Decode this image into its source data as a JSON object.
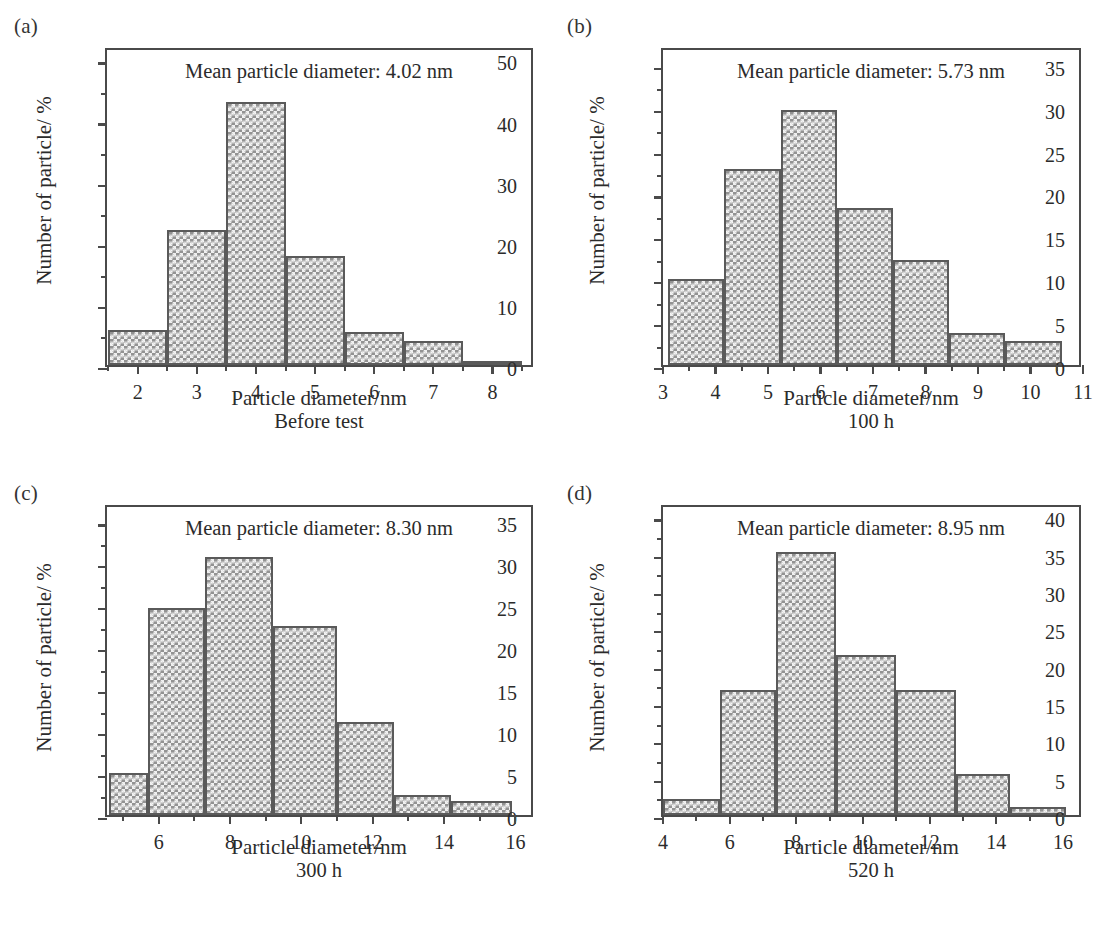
{
  "figure": {
    "background": "#ffffff",
    "ink_color": "#2b2b2b",
    "frame_color": "#4a4a4a",
    "bar_fill": "#b4b4b4",
    "bar_edge": "#5a5a5a"
  },
  "panels": [
    {
      "letter": "(a)",
      "mean_note": "Mean particle diameter: 4.02 nm",
      "xlabel": "Particle diameter/nm",
      "caption": "Before test",
      "ylabel": "Number of particle/ %"
    },
    {
      "letter": "(b)",
      "mean_note": "Mean particle diameter: 5.73 nm",
      "xlabel": "Particle diameter/nm",
      "caption": "100 h",
      "ylabel": "Number of particle/ %"
    },
    {
      "letter": "(c)",
      "mean_note": "Mean particle diameter: 8.30 nm",
      "xlabel": "Particle diameter/nm",
      "caption": "300 h",
      "ylabel": "Number of particle/ %"
    },
    {
      "letter": "(d)",
      "mean_note": "Mean particle diameter: 8.95 nm",
      "xlabel": "Particle diameter/nm",
      "caption": "520 h",
      "ylabel": "Number of particle/ %"
    }
  ],
  "chart_data": [
    {
      "type": "bar",
      "id": "panel-a",
      "title": "(a) Before test",
      "annotation": "Mean particle diameter: 4.02 nm",
      "mean_particle_diameter_nm": 4.02,
      "condition": "Before test",
      "xlabel": "Particle diameter/nm",
      "ylabel": "Number of particle/ %",
      "xlim": [
        1.48,
        8.72
      ],
      "ylim": [
        0,
        52.2
      ],
      "xticks": [
        2,
        3,
        4,
        5,
        6,
        7,
        8
      ],
      "xticklabels": [
        "2",
        "3",
        "4",
        "5",
        "6",
        "7",
        "8"
      ],
      "xminorticks": [
        1.5,
        2.5,
        3.5,
        4.5,
        5.5,
        6.5,
        7.5,
        8.5
      ],
      "yticks": [
        0,
        10,
        20,
        30,
        40,
        50
      ],
      "yticklabels": [
        "0",
        "10",
        "20",
        "30",
        "40",
        "50"
      ],
      "yminorticks": [
        5,
        15,
        25,
        35,
        45
      ],
      "grid": false,
      "legend": null,
      "bin_edges": [
        1.5,
        2.5,
        3.5,
        4.5,
        5.5,
        6.5,
        7.5,
        8.5
      ],
      "bin_centers": [
        2,
        3,
        4,
        5,
        6,
        7,
        8
      ],
      "categories": [
        "2",
        "3",
        "4",
        "5",
        "6",
        "7",
        "8"
      ],
      "values": [
        5.7,
        22.1,
        43.0,
        17.8,
        5.4,
        3.9,
        0.4
      ]
    },
    {
      "type": "bar",
      "id": "panel-b",
      "title": "(b) 100 h",
      "annotation": "Mean particle diameter: 5.73 nm",
      "mean_particle_diameter_nm": 5.73,
      "condition": "100 h",
      "xlabel": "Particle diameter/nm",
      "ylabel": "Number of particle/ %",
      "xlim": [
        3.0,
        11.0
      ],
      "ylim": [
        0,
        37.2
      ],
      "xticks": [
        3,
        4,
        5,
        6,
        7,
        8,
        9,
        10,
        11
      ],
      "xticklabels": [
        "3",
        "4",
        "5",
        "6",
        "7",
        "8",
        "9",
        "10",
        "11"
      ],
      "xminorticks": [
        3.5,
        4.5,
        5.5,
        6.5,
        7.5,
        8.5,
        9.5,
        10.5
      ],
      "yticks": [
        0,
        5,
        10,
        15,
        20,
        25,
        30,
        35
      ],
      "yticklabels": [
        "0",
        "5",
        "10",
        "15",
        "20",
        "25",
        "30",
        "35"
      ],
      "yminorticks": [
        2.5,
        7.5,
        12.5,
        17.5,
        22.5,
        27.5,
        32.5
      ],
      "grid": false,
      "legend": null,
      "bin_edges": [
        3.1,
        4.17,
        5.24,
        6.31,
        7.38,
        8.45,
        9.52,
        10.6
      ],
      "bin_centers": [
        3.64,
        4.71,
        5.78,
        6.85,
        7.92,
        8.99,
        10.06
      ],
      "categories": [
        "3.1-4.2",
        "4.2-5.2",
        "5.2-6.3",
        "6.3-7.4",
        "7.4-8.5",
        "8.5-9.5",
        "9.5-10.6"
      ],
      "values": [
        10.0,
        22.9,
        29.7,
        18.3,
        12.2,
        3.7,
        2.8
      ]
    },
    {
      "type": "bar",
      "id": "panel-c",
      "title": "(c) 300 h",
      "annotation": "Mean particle diameter: 8.30 nm",
      "mean_particle_diameter_nm": 8.3,
      "condition": "300 h",
      "xlabel": "Particle diameter/nm",
      "ylabel": "Number of particle/ %",
      "xlim": [
        4.55,
        16.55
      ],
      "ylim": [
        0,
        37.2
      ],
      "xticks": [
        6,
        8,
        10,
        12,
        14,
        16
      ],
      "xticklabels": [
        "6",
        "8",
        "10",
        "12",
        "14",
        "16"
      ],
      "xminorticks": [
        5,
        7,
        9,
        11,
        13,
        15
      ],
      "yticks": [
        0,
        5,
        10,
        15,
        20,
        25,
        30,
        35
      ],
      "yticklabels": [
        "0",
        "5",
        "10",
        "15",
        "20",
        "25",
        "30",
        "35"
      ],
      "yminorticks": [
        2.5,
        7.5,
        12.5,
        17.5,
        22.5,
        27.5,
        32.5
      ],
      "grid": false,
      "legend": null,
      "bin_edges": [
        4.6,
        5.7,
        7.3,
        9.2,
        11.0,
        12.6,
        14.2,
        15.9
      ],
      "bin_centers": [
        5.15,
        6.5,
        8.25,
        10.1,
        11.8,
        13.4,
        15.05
      ],
      "categories": [
        "4.6-5.7",
        "5.7-7.3",
        "7.3-9.2",
        "9.2-11.0",
        "11.0-12.6",
        "12.6-14.2",
        "14.2-15.9"
      ],
      "values": [
        5.0,
        24.7,
        30.8,
        22.5,
        11.1,
        2.4,
        1.7
      ]
    },
    {
      "type": "bar",
      "id": "panel-d",
      "title": "(d) 520 h",
      "annotation": "Mean particle diameter: 8.95 nm",
      "mean_particle_diameter_nm": 8.95,
      "condition": "520 h",
      "xlabel": "Particle diameter/nm",
      "ylabel": "Number of particle/ %",
      "xlim": [
        4.0,
        16.6
      ],
      "ylim": [
        0,
        41.8
      ],
      "xticks": [
        4,
        6,
        8,
        10,
        12,
        14,
        16
      ],
      "xticklabels": [
        "4",
        "6",
        "8",
        "10",
        "12",
        "14",
        "16"
      ],
      "xminorticks": [
        5,
        7,
        9,
        11,
        13,
        15
      ],
      "yticks": [
        0,
        5,
        10,
        15,
        20,
        25,
        30,
        35,
        40
      ],
      "yticklabels": [
        "0",
        "5",
        "10",
        "15",
        "20",
        "25",
        "30",
        "35",
        "40"
      ],
      "yminorticks": [
        2.5,
        7.5,
        12.5,
        17.5,
        22.5,
        27.5,
        32.5,
        37.5
      ],
      "grid": false,
      "legend": null,
      "bin_edges": [
        4.0,
        5.7,
        7.4,
        9.2,
        11.0,
        12.8,
        14.4,
        16.1
      ],
      "bin_centers": [
        4.85,
        6.55,
        8.3,
        10.1,
        11.9,
        13.6,
        15.25
      ],
      "categories": [
        "4.0-5.7",
        "5.7-7.4",
        "7.4-9.2",
        "9.2-11.0",
        "11.0-12.8",
        "12.8-14.4",
        "14.4-16.1"
      ],
      "values": [
        2.1,
        16.7,
        35.2,
        21.5,
        16.7,
        5.5,
        1.1
      ]
    }
  ]
}
